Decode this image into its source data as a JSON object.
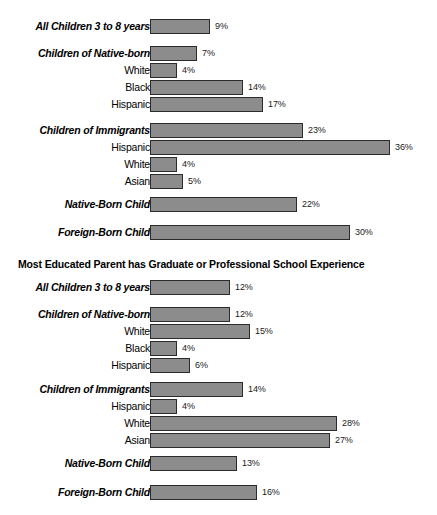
{
  "chart_data": {
    "type": "bar",
    "orientation": "horizontal",
    "title": "Most Educated Parent has Graduate or Professional School Experience",
    "xlabel": "",
    "ylabel": "",
    "xlim": [
      0,
      40
    ],
    "grid": false,
    "legend": null,
    "value_suffix": "%",
    "sections": [
      {
        "heading": "",
        "rows": [
          {
            "label": "All Children 3 to 8 years",
            "value": 9,
            "value_label": "9%",
            "style": "group"
          },
          {
            "label": "Children of Native-born",
            "value": 7,
            "value_label": "7%",
            "style": "group"
          },
          {
            "label": "White",
            "value": 4,
            "value_label": "4%",
            "style": "sub"
          },
          {
            "label": "Black",
            "value": 14,
            "value_label": "14%",
            "style": "sub"
          },
          {
            "label": "Hispanic",
            "value": 17,
            "value_label": "17%",
            "style": "sub"
          },
          {
            "label": "Children of Immigrants",
            "value": 23,
            "value_label": "23%",
            "style": "group"
          },
          {
            "label": "Hispanic",
            "value": 36,
            "value_label": "36%",
            "style": "sub"
          },
          {
            "label": "White",
            "value": 4,
            "value_label": "4%",
            "style": "sub"
          },
          {
            "label": "Asian",
            "value": 5,
            "value_label": "5%",
            "style": "sub"
          },
          {
            "label": "Native-Born Child",
            "value": 22,
            "value_label": "22%",
            "style": "group"
          },
          {
            "label": "Foreign-Born Child",
            "value": 30,
            "value_label": "30%",
            "style": "group"
          }
        ]
      },
      {
        "heading": "Most Educated Parent has Graduate or Professional School Experience",
        "rows": [
          {
            "label": "All Children 3 to 8 years",
            "value": 12,
            "value_label": "12%",
            "style": "group"
          },
          {
            "label": "Children of Native-born",
            "value": 12,
            "value_label": "12%",
            "style": "group"
          },
          {
            "label": "White",
            "value": 15,
            "value_label": "15%",
            "style": "sub"
          },
          {
            "label": "Black",
            "value": 4,
            "value_label": "4%",
            "style": "sub"
          },
          {
            "label": "Hispanic",
            "value": 6,
            "value_label": "6%",
            "style": "sub"
          },
          {
            "label": "Children of Immigrants",
            "value": 14,
            "value_label": "14%",
            "style": "group"
          },
          {
            "label": "Hispanic",
            "value": 4,
            "value_label": "4%",
            "style": "sub"
          },
          {
            "label": "White",
            "value": 28,
            "value_label": "28%",
            "style": "sub"
          },
          {
            "label": "Asian",
            "value": 27,
            "value_label": "27%",
            "style": "sub"
          },
          {
            "label": "Native-Born Child",
            "value": 13,
            "value_label": "13%",
            "style": "group"
          },
          {
            "label": "Foreign-Born Child",
            "value": 16,
            "value_label": "16%",
            "style": "group"
          }
        ]
      }
    ],
    "colors": {
      "bar_fill": "#8c8c8c",
      "bar_stroke": "#2b2b2b",
      "text": "#000000",
      "background": "#ffffff"
    }
  },
  "layout": {
    "bar_origin_x": 150,
    "px_per_percent": 6.67,
    "row_height": 17
  }
}
